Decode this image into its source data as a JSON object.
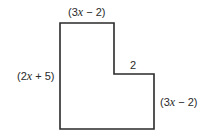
{
  "diagram": {
    "type": "L-shaped polygon with labeled side lengths",
    "stroke_color": "#2a2a2a",
    "background": "#ffffff",
    "vertices": [
      [
        60,
        23
      ],
      [
        114,
        23
      ],
      [
        114,
        74
      ],
      [
        154,
        74
      ],
      [
        154,
        129
      ],
      [
        60,
        129
      ]
    ],
    "labels": {
      "top": {
        "pre": "(3",
        "var": "x",
        "post": " − 2)"
      },
      "step": {
        "text": "2"
      },
      "left": {
        "pre": "(2",
        "var": "x",
        "post": " + 5)"
      },
      "right": {
        "pre": "(3",
        "var": "x",
        "post": " − 2)"
      }
    }
  }
}
